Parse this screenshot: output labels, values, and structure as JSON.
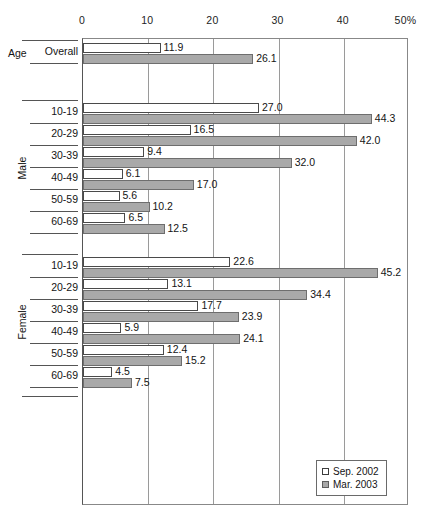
{
  "chart_data": {
    "type": "bar",
    "orientation": "horizontal",
    "title": "",
    "xlabel": "",
    "ylabel": "",
    "xlim": [
      0,
      50
    ],
    "xticks": [
      "0",
      "10",
      "20",
      "30",
      "40",
      "50%"
    ],
    "xtick_values": [
      0,
      10,
      20,
      30,
      40,
      50
    ],
    "grid": true,
    "legend_position": "bottom-right",
    "legend": [
      "Sep. 2002",
      "Mar. 2003"
    ],
    "series": [
      {
        "name": "Sep. 2002",
        "color": "#ffffff",
        "values": [
          11.9,
          27.0,
          16.5,
          9.4,
          6.1,
          5.6,
          6.5,
          22.6,
          13.1,
          17.7,
          5.9,
          12.4,
          4.5
        ]
      },
      {
        "name": "Mar. 2003",
        "color": "#a9a9a9",
        "values": [
          26.1,
          44.3,
          42.0,
          32.0,
          17.0,
          10.2,
          12.5,
          45.2,
          34.4,
          23.9,
          24.1,
          15.2,
          7.5
        ]
      }
    ],
    "groups": [
      {
        "group_label": "Age",
        "group_label_style": "horizontal",
        "categories": [
          {
            "label": "Overall",
            "sep_2002": 11.9,
            "mar_2003": 26.1
          }
        ]
      },
      {
        "group_label": "Male",
        "group_label_style": "rotated",
        "categories": [
          {
            "label": "10-19",
            "sep_2002": 27.0,
            "mar_2003": 44.3
          },
          {
            "label": "20-29",
            "sep_2002": 16.5,
            "mar_2003": 42.0
          },
          {
            "label": "30-39",
            "sep_2002": 9.4,
            "mar_2003": 32.0
          },
          {
            "label": "40-49",
            "sep_2002": 6.1,
            "mar_2003": 17.0
          },
          {
            "label": "50-59",
            "sep_2002": 5.6,
            "mar_2003": 10.2
          },
          {
            "label": "60-69",
            "sep_2002": 6.5,
            "mar_2003": 12.5
          }
        ]
      },
      {
        "group_label": "Female",
        "group_label_style": "rotated",
        "categories": [
          {
            "label": "10-19",
            "sep_2002": 22.6,
            "mar_2003": 45.2
          },
          {
            "label": "20-29",
            "sep_2002": 13.1,
            "mar_2003": 34.4
          },
          {
            "label": "30-39",
            "sep_2002": 17.7,
            "mar_2003": 23.9
          },
          {
            "label": "40-49",
            "sep_2002": 5.9,
            "mar_2003": 24.1
          },
          {
            "label": "50-59",
            "sep_2002": 12.4,
            "mar_2003": 15.2
          },
          {
            "label": "60-69",
            "sep_2002": 4.5,
            "mar_2003": 7.5
          }
        ]
      }
    ]
  },
  "legend": {
    "items": [
      {
        "label": "Sep. 2002",
        "swatch": "white-square",
        "color": "#ffffff"
      },
      {
        "label": "Mar. 2003",
        "swatch": "gray-square",
        "color": "#a9a9a9"
      }
    ]
  },
  "axis": {
    "ticks": [
      {
        "label": "0",
        "value": 0
      },
      {
        "label": "10",
        "value": 10
      },
      {
        "label": "20",
        "value": 20
      },
      {
        "label": "30",
        "value": 30
      },
      {
        "label": "40",
        "value": 40
      },
      {
        "label": "50%",
        "value": 50
      }
    ]
  }
}
